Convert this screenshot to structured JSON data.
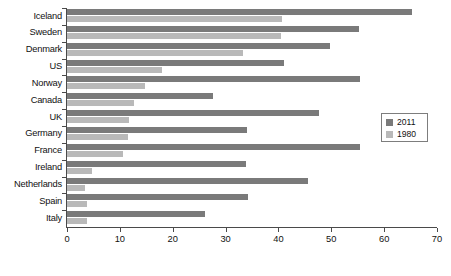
{
  "chart_data": {
    "type": "bar",
    "orientation": "horizontal",
    "title": "",
    "subtitle": "",
    "xlabel": "",
    "ylabel": "",
    "xlim": [
      0,
      70
    ],
    "xticks": [
      0,
      10,
      20,
      30,
      40,
      50,
      60,
      70
    ],
    "grid": false,
    "legend_position": "right",
    "categories": [
      "Iceland",
      "Sweden",
      "Denmark",
      "US",
      "Norway",
      "Canada",
      "UK",
      "Germany",
      "France",
      "Ireland",
      "Netherlands",
      "Spain",
      "Italy"
    ],
    "series": [
      {
        "name": "2011",
        "color": "#7a7a7a",
        "values": [
          65.2,
          55.2,
          49.7,
          41.0,
          55.4,
          27.6,
          47.6,
          34.0,
          55.4,
          33.8,
          45.6,
          34.2,
          26.1
        ]
      },
      {
        "name": "1980",
        "color": "#b9b9b9",
        "values": [
          40.6,
          40.4,
          33.3,
          18.0,
          14.7,
          12.7,
          11.7,
          11.5,
          10.6,
          4.7,
          3.4,
          3.8,
          3.8
        ]
      }
    ]
  },
  "legend": {
    "entries": [
      {
        "label": "2011",
        "color": "#7a7a7a"
      },
      {
        "label": "1980",
        "color": "#b9b9b9"
      }
    ]
  },
  "axis": {
    "x_tick_labels": [
      "0",
      "10",
      "20",
      "30",
      "40",
      "50",
      "60",
      "70"
    ],
    "axis_color": "#4a4a4a"
  }
}
